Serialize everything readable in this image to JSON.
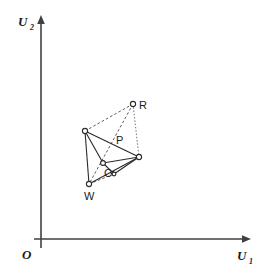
{
  "figure": {
    "type": "geometric-diagram",
    "background_color": "#ffffff",
    "line_color": "#2b2b2b",
    "axis_color": "#404040",
    "width": 264,
    "height": 274,
    "axes": {
      "origin_label": "O",
      "origin_pos": [
        27,
        254
      ],
      "x_axis": {
        "label": "U",
        "subscript": "1",
        "label_pos": [
          240,
          258
        ],
        "from": [
          41,
          239
        ],
        "to": [
          250,
          239
        ]
      },
      "y_axis": {
        "label": "U",
        "subscript": "2",
        "label_pos": [
          20,
          25
        ],
        "from": [
          41,
          248
        ],
        "to": [
          41,
          17
        ]
      }
    },
    "vertices": [
      {
        "id": "L",
        "label": "",
        "x": 85,
        "y": 131,
        "r": 2.6
      },
      {
        "id": "R",
        "label": "R",
        "x": 133,
        "y": 104,
        "r": 2.6,
        "label_pos": [
          139,
          109
        ]
      },
      {
        "id": "E",
        "label": "",
        "x": 139,
        "y": 157,
        "r": 2.6
      },
      {
        "id": "C",
        "label": "C",
        "x": 103,
        "y": 163,
        "r": 2.4,
        "label_pos": [
          104,
          177
        ]
      },
      {
        "id": "W",
        "label": "W",
        "x": 89,
        "y": 184,
        "r": 2.6,
        "label_pos": [
          84,
          200
        ]
      },
      {
        "id": "Q",
        "label": "",
        "x": 114,
        "y": 174,
        "r": 1.9
      }
    ],
    "point_labels": [
      {
        "text": "P",
        "x": 116,
        "y": 144
      }
    ],
    "edges": [
      {
        "from": "L",
        "to": "E",
        "style": "solid"
      },
      {
        "from": "L",
        "to": "C",
        "style": "solid"
      },
      {
        "from": "L",
        "to": "W",
        "style": "solid"
      },
      {
        "from": "C",
        "to": "E",
        "style": "solid"
      },
      {
        "from": "W",
        "to": "E",
        "style": "solid"
      },
      {
        "from": "C",
        "to": "Q",
        "style": "solid"
      },
      {
        "from": "Q",
        "to": "E",
        "style": "solid"
      },
      {
        "from": "L",
        "to": "R",
        "style": "dashed"
      },
      {
        "from": "R",
        "to": "E",
        "style": "dotted"
      },
      {
        "from": "R",
        "to": "W",
        "style": "dashed"
      },
      {
        "from": "W",
        "to": "Q",
        "style": "dashed"
      }
    ]
  }
}
